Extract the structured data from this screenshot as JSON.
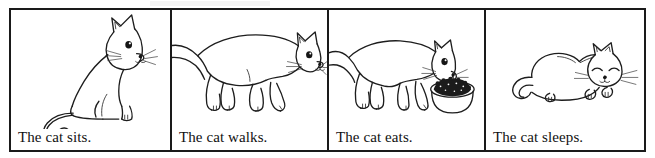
{
  "strip": {
    "title": "The cat sequence",
    "panel_count": 4,
    "border_color": "#1a1a1a",
    "ink_color": "#1d1d1d",
    "background_color": "#ffffff",
    "style": "black-and-white line drawing"
  },
  "panels": [
    {
      "index": 1,
      "caption": "The cat sits.",
      "subject": "cat",
      "action": "sits",
      "art_name": "cat-sitting-illustration",
      "details": "cat seated upright in profile facing right, long curled tail sweeping left"
    },
    {
      "index": 2,
      "caption": "The cat walks.",
      "subject": "cat",
      "action": "walks",
      "art_name": "cat-walking-illustration",
      "details": "cat striding right on four legs, tail raised and clipped by the panel edge"
    },
    {
      "index": 3,
      "caption": "The cat eats.",
      "subject": "cat",
      "action": "eats",
      "art_name": "cat-eating-illustration",
      "details": "cat leaning down over a round bowl filled with dark kibble"
    },
    {
      "index": 4,
      "caption": "The cat sleeps.",
      "subject": "cat",
      "action": "sleeps",
      "art_name": "cat-sleeping-illustration",
      "details": "cat curled lying down with eyes closed and paws tucked forward"
    }
  ]
}
